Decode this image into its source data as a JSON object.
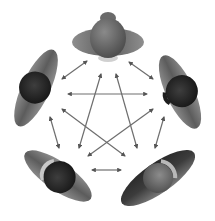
{
  "diagram": {
    "title": "",
    "background": "#fdfdfd",
    "arrow_color": "#6e6e6e",
    "people": [
      {
        "id": "top",
        "label": "",
        "cx": 108,
        "cy": 40,
        "angle": 0,
        "body_color": "#5a5a5a",
        "head_color": "#6e6e6e"
      },
      {
        "id": "left",
        "label": "",
        "cx": 36,
        "cy": 88,
        "angle": -65,
        "body_color": "#6a6a6a",
        "head_color": "#2e2e2e"
      },
      {
        "id": "right",
        "label": "",
        "cx": 180,
        "cy": 92,
        "angle": 70,
        "body_color": "#6a6a6a",
        "head_color": "#262626"
      },
      {
        "id": "bottom-left",
        "label": "",
        "cx": 60,
        "cy": 178,
        "angle": 120,
        "body_color": "#7a7a7a",
        "head_color": "#333333"
      },
      {
        "id": "bottom-right",
        "label": "",
        "cx": 158,
        "cy": 178,
        "angle": -125,
        "body_color": "#3a3a3a",
        "head_color": "#6a6a6a"
      }
    ],
    "connections": [
      {
        "from": "top",
        "to": "left",
        "x1": 87,
        "y1": 61,
        "x2": 62,
        "y2": 79
      },
      {
        "from": "top",
        "to": "right",
        "x1": 129,
        "y1": 62,
        "x2": 153,
        "y2": 79
      },
      {
        "from": "left",
        "to": "right",
        "x1": 68,
        "y1": 94,
        "x2": 147,
        "y2": 94
      },
      {
        "from": "top",
        "to": "bottom-left",
        "x1": 101,
        "y1": 74,
        "x2": 79,
        "y2": 148
      },
      {
        "from": "top",
        "to": "bottom-right",
        "x1": 116,
        "y1": 74,
        "x2": 137,
        "y2": 148
      },
      {
        "from": "left",
        "to": "bottom-right",
        "x1": 62,
        "y1": 109,
        "x2": 125,
        "y2": 156
      },
      {
        "from": "right",
        "to": "bottom-left",
        "x1": 153,
        "y1": 109,
        "x2": 88,
        "y2": 156
      },
      {
        "from": "left",
        "to": "bottom-left",
        "x1": 50,
        "y1": 117,
        "x2": 59,
        "y2": 148
      },
      {
        "from": "right",
        "to": "bottom-right",
        "x1": 164,
        "y1": 117,
        "x2": 155,
        "y2": 148
      },
      {
        "from": "bottom-left",
        "to": "bottom-right",
        "x1": 92,
        "y1": 170,
        "x2": 121,
        "y2": 170
      }
    ]
  }
}
